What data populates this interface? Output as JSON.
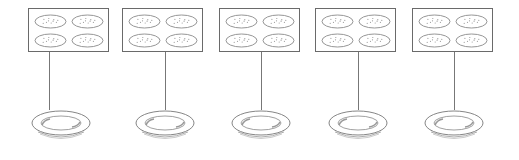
{
  "diagram": {
    "colors": {
      "stroke": "#6a6a6a",
      "background": "#ffffff"
    },
    "groups": [
      {
        "box_x": 28,
        "line_x": 49,
        "plate_x": 30,
        "cookies_per_box": 4,
        "item": "cookie-box",
        "target": "plate"
      },
      {
        "box_x": 122,
        "line_x": 165,
        "plate_x": 134,
        "cookies_per_box": 4,
        "item": "cookie-box",
        "target": "plate"
      },
      {
        "box_x": 219,
        "line_x": 261,
        "plate_x": 230,
        "cookies_per_box": 4,
        "item": "cookie-box",
        "target": "plate"
      },
      {
        "box_x": 315,
        "line_x": 358,
        "plate_x": 327,
        "cookies_per_box": 4,
        "item": "cookie-box",
        "target": "plate"
      },
      {
        "box_x": 412,
        "line_x": 454,
        "plate_x": 423,
        "cookies_per_box": 4,
        "item": "cookie-box",
        "target": "plate"
      }
    ]
  }
}
